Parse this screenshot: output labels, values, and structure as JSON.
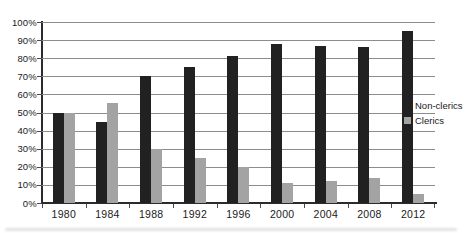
{
  "chart_data": {
    "type": "bar",
    "title": "",
    "xlabel": "",
    "ylabel": "",
    "categories": [
      "1980",
      "1984",
      "1988",
      "1992",
      "1996",
      "2000",
      "2004",
      "2008",
      "2012"
    ],
    "series": [
      {
        "name": "Non-clerics",
        "color": "#212121",
        "values": [
          50,
          45,
          70,
          75,
          81,
          88,
          87,
          86,
          95
        ]
      },
      {
        "name": "Clerics",
        "color": "#a3a3a3",
        "values": [
          50,
          55,
          30,
          25,
          20,
          11,
          12,
          14,
          5
        ]
      }
    ],
    "ylim": [
      0,
      100
    ],
    "y_tick_step": 10,
    "y_tick_labels": [
      "0%",
      "10%",
      "20%",
      "30%",
      "40%",
      "50%",
      "60%",
      "70%",
      "80%",
      "90%",
      "100%"
    ],
    "grid": true,
    "legend_position": "right"
  }
}
